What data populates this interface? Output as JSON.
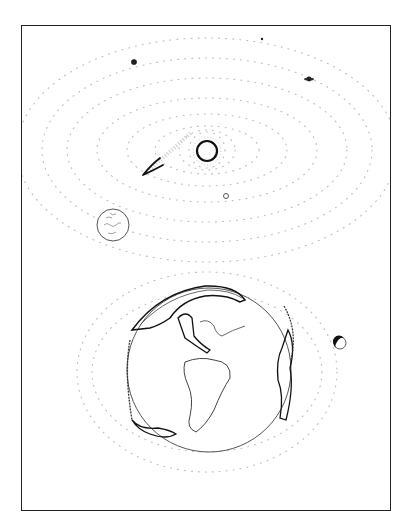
{
  "illustration": {
    "title": "",
    "description": "Line-art solar system illustration with dotted orbits, sun, comet, planets, Earth and Moon",
    "colors": {
      "ink": "#222222",
      "orbit": "#b8b8b8",
      "background": "#ffffff"
    },
    "bodies": [
      {
        "name": "sun",
        "x": 207,
        "y": 151,
        "r": 10
      },
      {
        "name": "comet",
        "x": 150,
        "y": 170
      },
      {
        "name": "small-planet",
        "x": 226,
        "y": 196,
        "r": 2.5
      },
      {
        "name": "mars",
        "x": 113,
        "y": 225,
        "r": 16
      },
      {
        "name": "dark-planet",
        "x": 134,
        "y": 62,
        "r": 2.5
      },
      {
        "name": "saturn",
        "x": 309,
        "y": 79,
        "r": 3
      },
      {
        "name": "distant-dot",
        "x": 262,
        "y": 39,
        "r": 1
      },
      {
        "name": "earth",
        "x": 209,
        "y": 370,
        "r": 82
      },
      {
        "name": "moon",
        "x": 340,
        "y": 343,
        "r": 6
      }
    ]
  }
}
